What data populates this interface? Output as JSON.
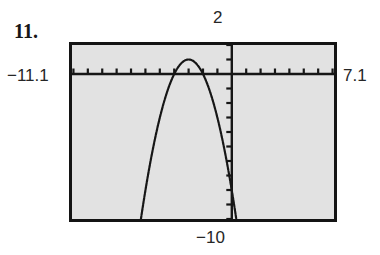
{
  "exercise": {
    "number": "11."
  },
  "graph_window": {
    "xmin_label": "−11.1",
    "xmax_label": "7.1",
    "ymax_label": "2",
    "ymin_label": "−10"
  },
  "colors": {
    "screen_background": "#e2e2e2",
    "bezel": "#141414",
    "ink": "#161616",
    "page_background": "#ffffff"
  },
  "chart_data": {
    "type": "line",
    "title": "",
    "subtitle": "",
    "xlabel": "",
    "ylabel": "",
    "grid": false,
    "legend": "none",
    "axis_style": "calculator-screen-with-unit-tick-marks",
    "xlim": [
      -11.1,
      7.1
    ],
    "ylim": [
      -10,
      2
    ],
    "x_tick_interval": 1,
    "y_tick_interval": 1,
    "tick_labels_shown": false,
    "corner_labels": {
      "top": "2",
      "left": "−11.1",
      "right": "7.1",
      "bottom": "−10"
    },
    "series": [
      {
        "name": "parabola",
        "shape": "downward-opening parabola",
        "vertex": [
          -3.0,
          1.0
        ],
        "x_intercepts": [
          -4.0,
          -2.0
        ],
        "y_intercept": -8.0,
        "x": [
          -11.1,
          -10.5,
          -10.0,
          -9.5,
          -9.0,
          -8.5,
          -8.0,
          -7.5,
          -7.0,
          -6.5,
          -6.0,
          -5.5,
          -5.0,
          -4.5,
          -4.0,
          -3.5,
          -3.0,
          -2.5,
          -2.0,
          -1.5,
          -1.0,
          -0.5,
          0.0,
          0.5,
          1.0,
          1.5,
          2.0,
          2.5,
          3.0
        ],
        "y": [
          -64.8,
          -55.3,
          -48.0,
          -41.3,
          -35.0,
          -29.3,
          -24.0,
          -19.3,
          -15.0,
          -11.3,
          -8.0,
          -5.3,
          -3.0,
          -1.3,
          0.0,
          0.8,
          1.0,
          0.8,
          0.0,
          -1.3,
          -3.0,
          -5.3,
          -8.0,
          -11.3,
          -15.0,
          -19.3,
          -24.0,
          -29.3,
          -35.0
        ]
      }
    ]
  }
}
